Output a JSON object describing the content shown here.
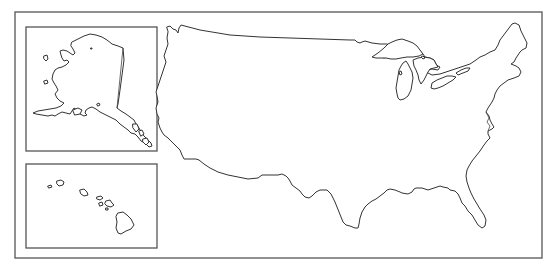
{
  "map": {
    "title": "Outline map of the United States",
    "colors": {
      "background": "#ffffff",
      "outline": "#333333",
      "frame": "#555555"
    },
    "frame": {
      "x": 15,
      "y": 12,
      "width": 527,
      "height": 246
    },
    "insets": [
      {
        "name": "Alaska",
        "x": 26,
        "y": 27,
        "width": 131,
        "height": 124
      },
      {
        "name": "Hawaii",
        "x": 26,
        "y": 164,
        "width": 131,
        "height": 84
      }
    ],
    "main": {
      "name": "Contiguous United States"
    }
  }
}
